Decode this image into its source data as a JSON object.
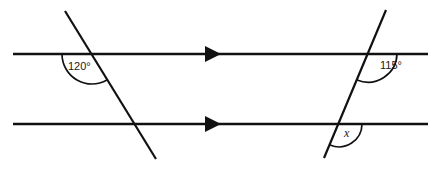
{
  "figure": {
    "kind": "geometry-diagram",
    "title": "",
    "background_color": "#ffffff",
    "stroke_color": "#111111",
    "text_color": "#1a1a1a",
    "width": 439,
    "height": 171
  },
  "parallel_lines": [
    {
      "name": "upper-parallel-line",
      "y": 54,
      "x_start": 13,
      "x_end": 428,
      "arrow_marker": {
        "name": "single-arrow-marker",
        "x": 208,
        "direction": "right",
        "count": 1
      }
    },
    {
      "name": "lower-parallel-line",
      "y": 124,
      "x_start": 13,
      "x_end": 428,
      "arrow_marker": {
        "name": "single-arrow-marker",
        "x": 208,
        "direction": "right",
        "count": 1
      }
    }
  ],
  "transversals": [
    {
      "name": "left-transversal",
      "x1": 65,
      "y1": 11,
      "x2": 156,
      "y2": 159,
      "intersects_upper_at_x": 92,
      "intersects_lower_at_x": 135
    },
    {
      "name": "right-transversal",
      "x1": 386,
      "y1": 10,
      "x2": 324,
      "y2": 158,
      "intersects_upper_at_x": 368,
      "intersects_lower_at_x": 339
    }
  ],
  "angles": [
    {
      "name": "angle-120",
      "label": "120°",
      "value": 120,
      "unit": "degrees",
      "vertex_x": 92,
      "vertex_y": 54,
      "radius": 30,
      "start_angle_deg": 180,
      "end_angle_deg": 59,
      "label_x": 82,
      "label_y": 69,
      "style": "upright",
      "position": "below-left of upper intersection, left transversal"
    },
    {
      "name": "angle-115",
      "label": "115°",
      "value": 115,
      "unit": "degrees",
      "vertex_x": 368,
      "vertex_y": 54,
      "radius": 29,
      "start_angle_deg": 0,
      "end_angle_deg": 113,
      "label_x": 393,
      "label_y": 68,
      "style": "upright",
      "position": "below-right of upper intersection, right transversal"
    },
    {
      "name": "angle-x-unknown",
      "label": "x",
      "value": null,
      "unit": "degrees",
      "vertex_x": 339,
      "vertex_y": 124,
      "radius": 23,
      "start_angle_deg": 0,
      "end_angle_deg": 113,
      "label_x": 347,
      "label_y": 135,
      "style": "italic",
      "position": "below-right of lower intersection, right transversal"
    }
  ],
  "labels": {
    "angle_120_text": "120°",
    "angle_115_text": "115°",
    "angle_x_text": "x"
  }
}
